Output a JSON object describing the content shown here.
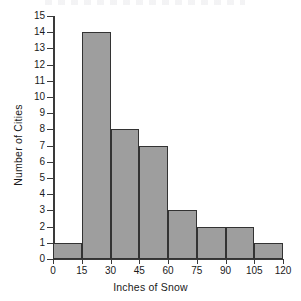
{
  "chart_data": {
    "type": "bar",
    "title": "",
    "xlabel": "Inches of Snow",
    "ylabel": "Number of Cities",
    "categories": [
      "0-15",
      "15-30",
      "30-45",
      "45-60",
      "60-75",
      "75-90",
      "90-105",
      "105-120"
    ],
    "bin_edges": [
      0,
      15,
      30,
      45,
      60,
      75,
      90,
      105,
      120
    ],
    "values": [
      1,
      14,
      8,
      7,
      3,
      2,
      2,
      1
    ],
    "bin_width": 15,
    "xlim": [
      0,
      120
    ],
    "ylim": [
      0,
      15
    ],
    "x_tick_labels": [
      "0",
      "15",
      "30",
      "45",
      "60",
      "75",
      "90",
      "105",
      "120"
    ],
    "y_tick_labels": [
      "0",
      "1",
      "2",
      "3",
      "4",
      "5",
      "6",
      "7",
      "8",
      "9",
      "10",
      "11",
      "12",
      "13",
      "14",
      "15"
    ],
    "grid": false,
    "legend": false,
    "bar_fill_color": "#9e9e9e",
    "bar_edge_color": "#333333",
    "axis_color": "#3a3a3a",
    "background_color": "#ffffff"
  }
}
